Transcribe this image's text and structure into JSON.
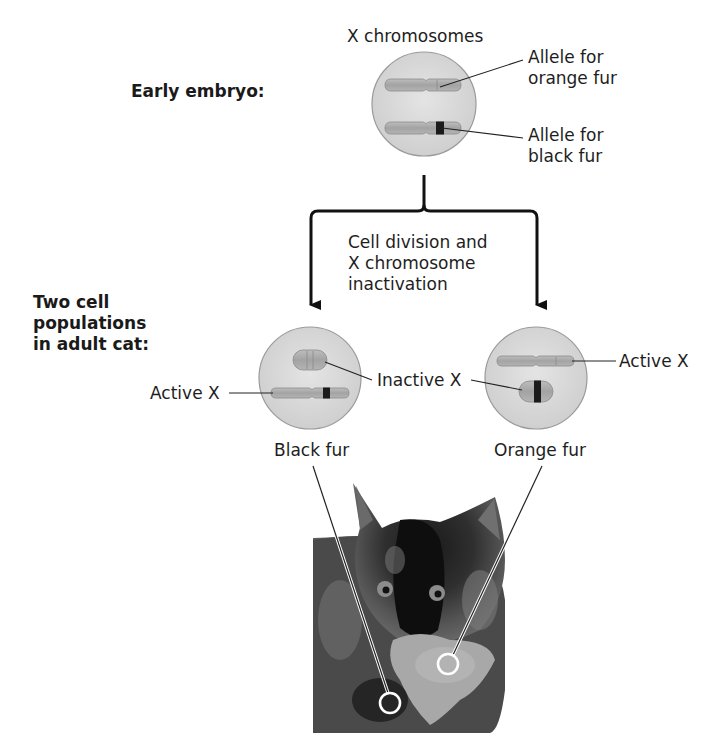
{
  "figure": {
    "stages": {
      "early_embryo": "Early embryo:",
      "adult_cat": "Two cell\npopulations\nin adult cat:"
    },
    "top_cell": {
      "title": "X chromosomes",
      "allele_orange": "Allele for\norange fur",
      "allele_black": "Allele for\nblack fur"
    },
    "process_label": "Cell division and\nX chromosome\ninactivation",
    "left_cell": {
      "active_label": "Active X",
      "inactive_label": "Inactive X",
      "phenotype": "Black fur"
    },
    "right_cell": {
      "active_label": "Active X",
      "inactive_label": "Inactive X",
      "phenotype": "Orange fur"
    },
    "photo": {
      "subject": "tortoiseshell-kitten"
    }
  },
  "colors": {
    "cell_fill": "#d9d9d9",
    "cell_stroke": "#9a9a9a",
    "chromosome_fill": "#a9a9a9",
    "allele_black": "#1b1b1b",
    "arrow": "#111111"
  }
}
